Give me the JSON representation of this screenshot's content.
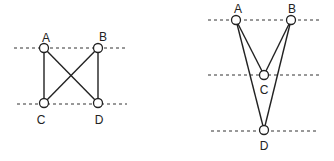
{
  "diagrams": [
    {
      "id": "left",
      "dashed_lines": [
        {
          "x1": 14,
          "x2": 128,
          "y": 48
        },
        {
          "x1": 17,
          "x2": 127,
          "y": 104
        }
      ],
      "nodes": [
        {
          "label": "A",
          "x": 44,
          "y": 48,
          "label_x": 46,
          "label_y": 42
        },
        {
          "label": "B",
          "x": 98,
          "y": 48,
          "label_x": 103,
          "label_y": 41
        },
        {
          "label": "C",
          "x": 44,
          "y": 103,
          "label_x": 41,
          "label_y": 124
        },
        {
          "label": "D",
          "x": 98,
          "y": 103,
          "label_x": 99,
          "label_y": 124
        }
      ],
      "edges": [
        [
          "A",
          "C"
        ],
        [
          "B",
          "D"
        ],
        [
          "A",
          "D"
        ],
        [
          "B",
          "C"
        ]
      ]
    },
    {
      "id": "right",
      "dashed_lines": [
        {
          "x1": 208,
          "x2": 320,
          "y": 20
        },
        {
          "x1": 208,
          "x2": 320,
          "y": 75
        },
        {
          "x1": 211,
          "x2": 318,
          "y": 131
        }
      ],
      "nodes": [
        {
          "label": "A",
          "x": 236,
          "y": 20,
          "label_x": 238,
          "label_y": 13
        },
        {
          "label": "B",
          "x": 291,
          "y": 20,
          "label_x": 292,
          "label_y": 13
        },
        {
          "label": "C",
          "x": 264,
          "y": 75,
          "label_x": 264,
          "label_y": 94
        },
        {
          "label": "D",
          "x": 264,
          "y": 130,
          "label_x": 264,
          "label_y": 150
        }
      ],
      "edges": [
        [
          "A",
          "C"
        ],
        [
          "B",
          "C"
        ],
        [
          "A",
          "D"
        ],
        [
          "B",
          "D"
        ]
      ]
    }
  ],
  "style": {
    "line_color": "#222222",
    "dash_color": "#333333",
    "node_radius": 4.5,
    "background": "#ffffff"
  }
}
